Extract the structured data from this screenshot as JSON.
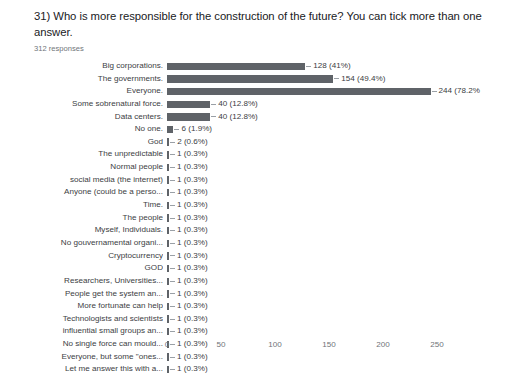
{
  "header": {
    "question": "31) Who is more responsible for the construction of the future? You can tick more than one answer.",
    "responses": "312 responses"
  },
  "chart_data": {
    "type": "bar",
    "orientation": "horizontal",
    "title": "31) Who is more responsible for the construction of the future? You can tick more than one answer.",
    "subtitle": "312 responses",
    "xlabel": "",
    "ylabel": "",
    "xlim": [
      0,
      260
    ],
    "xticks": [
      0,
      50,
      100,
      150,
      200,
      250
    ],
    "xtick_labels": [
      "0",
      "50",
      "100",
      "150",
      "200",
      "250"
    ],
    "grid": false,
    "legend": false,
    "bar_color": "#5f6368",
    "total_responses": 312,
    "categories": [
      "Big corporations.",
      "The governments.",
      "Everyone.",
      "Some sobrenatural force.",
      "Data centers.",
      "No one.",
      "God",
      "The unpredictable",
      "Normal people",
      "social media (the internet)",
      "Anyone (could be a perso...",
      "Time.",
      "The people",
      "Myself, Individuals.",
      "No gouvernamental organi...",
      "Cryptocurrency",
      "GOD",
      "Researchers, Universities...",
      "People get the system an...",
      "More fortunate can help",
      "Technologists and scientists",
      "influential small groups an...",
      "No single force can mould...",
      "Everyone, but some \"ones...",
      "Let me answer this with a..."
    ],
    "values": [
      128,
      154,
      244,
      40,
      40,
      6,
      2,
      1,
      1,
      1,
      1,
      1,
      1,
      1,
      1,
      1,
      1,
      1,
      1,
      1,
      1,
      1,
      1,
      1,
      1
    ],
    "percents": [
      "41%",
      "49.4%",
      "78.2%",
      "12.8%",
      "12.8%",
      "1.9%",
      "0.6%",
      "0.3%",
      "0.3%",
      "0.3%",
      "0.3%",
      "0.3%",
      "0.3%",
      "0.3%",
      "0.3%",
      "0.3%",
      "0.3%",
      "0.3%",
      "0.3%",
      "0.3%",
      "0.3%",
      "0.3%",
      "0.3%",
      "0.3%",
      "0.3%"
    ],
    "data_labels": [
      "128 (41%)",
      "154 (49.4%)",
      "244 (78.2%",
      "40 (12.8%)",
      "40 (12.8%)",
      "6 (1.9%)",
      "2 (0.6%)",
      "1 (0.3%)",
      "1 (0.3%)",
      "1 (0.3%)",
      "1 (0.3%)",
      "1 (0.3%)",
      "1 (0.3%)",
      "1 (0.3%)",
      "1 (0.3%)",
      "1 (0.3%)",
      "1 (0.3%)",
      "1 (0.3%)",
      "1 (0.3%)",
      "1 (0.3%)",
      "1 (0.3%)",
      "1 (0.3%)",
      "1 (0.3%)",
      "1 (0.3%)",
      "1 (0.3%)"
    ]
  }
}
